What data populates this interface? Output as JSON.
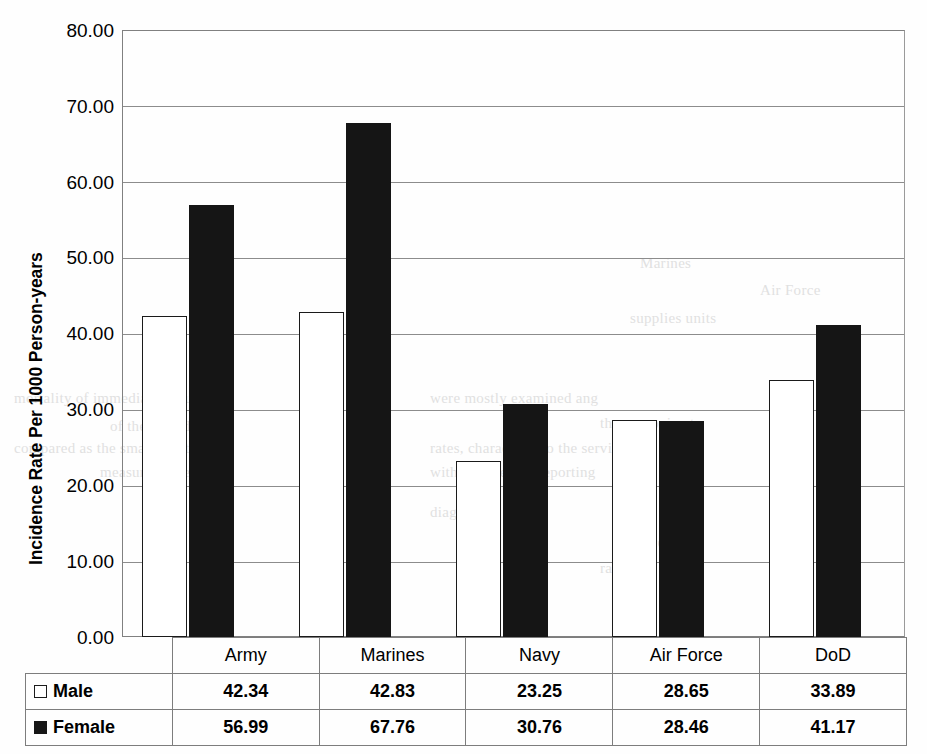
{
  "chart_data": {
    "type": "bar",
    "title": "",
    "xlabel": "",
    "ylabel": "Incidence Rate Per 1000 Person-years",
    "ylim": [
      0,
      80
    ],
    "ytick_labels": [
      "80.00",
      "70.00",
      "60.00",
      "50.00",
      "40.00",
      "30.00",
      "20.00",
      "10.00",
      "0.00"
    ],
    "ytick_values": [
      80,
      70,
      60,
      50,
      40,
      30,
      20,
      10,
      0
    ],
    "grid": true,
    "legend_position": "table-row-headers",
    "categories": [
      "Army",
      "Marines",
      "Navy",
      "Air Force",
      "DoD"
    ],
    "series": [
      {
        "name": "Male",
        "swatch": "open-square",
        "color": "#ffffff",
        "values": [
          42.34,
          42.83,
          23.25,
          28.65,
          33.89
        ],
        "labels": [
          "42.34",
          "42.83",
          "23.25",
          "28.65",
          "33.89"
        ]
      },
      {
        "name": "Female",
        "swatch": "filled-square",
        "color": "#151515",
        "values": [
          56.99,
          67.76,
          30.76,
          28.46,
          41.17
        ],
        "labels": [
          "56.99",
          "67.76",
          "30.76",
          "28.46",
          "41.17"
        ]
      }
    ]
  },
  "axis": {
    "y_title": "Incidence Rate Per 1000 Person-years",
    "ticks": [
      {
        "label": "80.00"
      },
      {
        "label": "70.00"
      },
      {
        "label": "60.00"
      },
      {
        "label": "50.00"
      },
      {
        "label": "40.00"
      },
      {
        "label": "30.00"
      },
      {
        "label": "20.00"
      },
      {
        "label": "10.00"
      },
      {
        "label": "0.00"
      }
    ]
  },
  "table": {
    "category_headers": [
      "Army",
      "Marines",
      "Navy",
      "Air Force",
      "DoD"
    ],
    "rows": [
      {
        "legend_label": "Male",
        "values": [
          "42.34",
          "42.83",
          "23.25",
          "28.65",
          "33.89"
        ]
      },
      {
        "legend_label": "Female",
        "values": [
          "56.99",
          "67.76",
          "30.76",
          "28.46",
          "41.17"
        ]
      }
    ]
  },
  "ghost_text": [
    {
      "text": "DoD",
      "x": 196,
      "y": 245
    },
    {
      "text": "Marines",
      "x": 640,
      "y": 255
    },
    {
      "text": "Air Force",
      "x": 760,
      "y": 282
    },
    {
      "text": "supplies units",
      "x": 630,
      "y": 310
    },
    {
      "text": "mortality of immediate occupa",
      "x": 14,
      "y": 390
    },
    {
      "text": "were mostly examined ang",
      "x": 430,
      "y": 390
    },
    {
      "text": "of the recorded",
      "x": 110,
      "y": 418
    },
    {
      "text": "the approximate",
      "x": 600,
      "y": 415
    },
    {
      "text": "compared as the smaller data of",
      "x": 14,
      "y": 440
    },
    {
      "text": "rates, characterin to the service",
      "x": 430,
      "y": 440
    },
    {
      "text": "measure value",
      "x": 100,
      "y": 464
    },
    {
      "text": "with the average reporting",
      "x": 430,
      "y": 464
    },
    {
      "text": "diagnosed",
      "x": 430,
      "y": 504
    },
    {
      "text": "service",
      "x": 620,
      "y": 534
    },
    {
      "text": "rapidly",
      "x": 600,
      "y": 560
    }
  ]
}
